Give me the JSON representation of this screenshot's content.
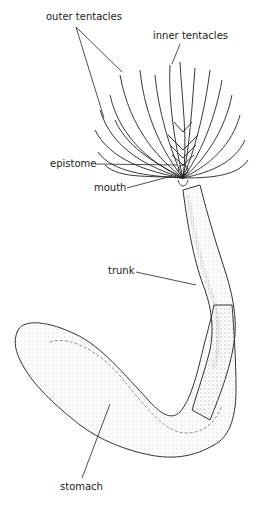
{
  "diagram": {
    "labels": {
      "outer_tentacles": "outer tentacles",
      "inner_tentacles": "inner tentacles",
      "epistome": "epistome",
      "mouth": "mouth",
      "trunk": "trunk",
      "stomach": "stomach"
    },
    "colors": {
      "ink": "#222222",
      "background": "#ffffff",
      "stipple": "#8a8a8a"
    }
  }
}
